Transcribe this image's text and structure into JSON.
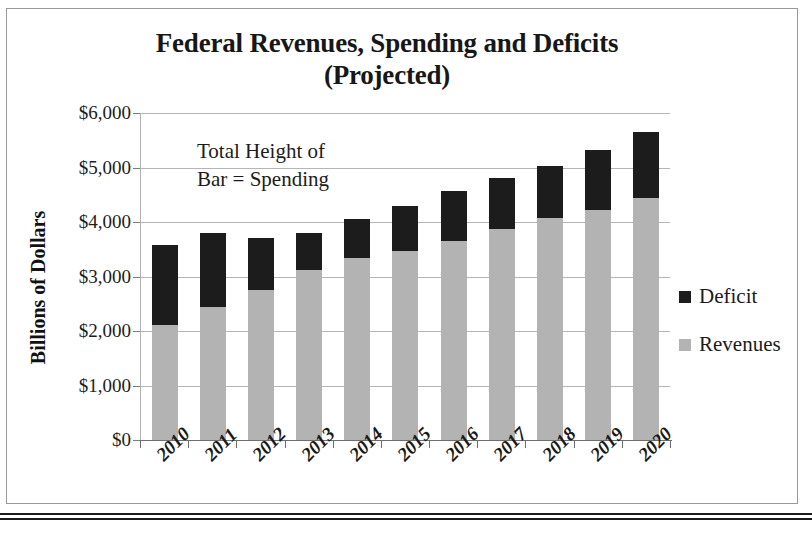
{
  "chart_data": {
    "type": "bar",
    "title": "Federal Revenues, Spending and Deficits (Projected)",
    "title_line1": "Federal Revenues, Spending and Deficits",
    "title_line2": "(Projected)",
    "stacked": true,
    "xlabel": "",
    "ylabel": "Billions of Dollars",
    "ylim": [
      0,
      6000
    ],
    "ytick_labels": [
      "$6,000",
      "$5,000",
      "$4,000",
      "$3,000",
      "$2,000",
      "$1,000",
      "$0"
    ],
    "ytick_values": [
      6000,
      5000,
      4000,
      3000,
      2000,
      1000,
      0
    ],
    "grid": true,
    "grid_axis": "y",
    "legend_position": "right",
    "categories": [
      "2010",
      "2011",
      "2012",
      "2013",
      "2014",
      "2015",
      "2016",
      "2017",
      "2018",
      "2019",
      "2020"
    ],
    "series": [
      {
        "name": "Deficit",
        "color": "#1c1c1c",
        "values": [
          1470,
          1350,
          960,
          680,
          710,
          830,
          920,
          940,
          960,
          1110,
          1220
        ]
      },
      {
        "name": "Revenues",
        "color": "#b3b3b3",
        "values": [
          2110,
          2440,
          2750,
          3120,
          3340,
          3470,
          3650,
          3870,
          4070,
          4220,
          4440
        ]
      }
    ],
    "totals": {
      "name": "Spending (total bar height)",
      "values": [
        3580,
        3790,
        3710,
        3800,
        4050,
        4300,
        4570,
        4810,
        5030,
        5330,
        5660
      ]
    },
    "annotations": [
      {
        "text": "Total Height of Bar = Spending",
        "line1": "Total Height of",
        "line2": "Bar = Spending"
      }
    ]
  },
  "legend": {
    "items": [
      {
        "label": "Deficit",
        "color": "#1c1c1c"
      },
      {
        "label": "Revenues",
        "color": "#b3b3b3"
      }
    ]
  }
}
